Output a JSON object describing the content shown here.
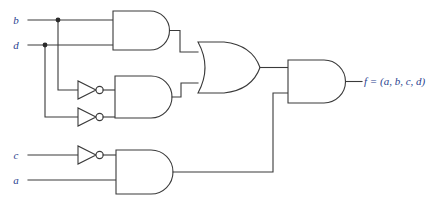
{
  "figure": {
    "type": "logic-circuit-diagram",
    "width": 438,
    "height": 205,
    "background_color": "#ffffff",
    "wire_color": "#3a3a3a",
    "label_color": "#2b3f8f"
  },
  "inputs": [
    {
      "id": "b",
      "label": "b",
      "x": 16,
      "y": 24,
      "wire_y": 20
    },
    {
      "id": "d",
      "label": "d",
      "x": 16,
      "y": 49,
      "wire_y": 45
    },
    {
      "id": "c",
      "label": "c",
      "x": 16,
      "y": 159,
      "wire_y": 155
    },
    {
      "id": "a",
      "label": "a",
      "x": 16,
      "y": 184,
      "wire_y": 180
    }
  ],
  "output": {
    "id": "f",
    "label": "f = (a, b, c, d)",
    "x": 362,
    "y": 85
  },
  "gates": [
    {
      "id": "and1",
      "type": "AND",
      "label": "AND",
      "inputs": [
        "b",
        "d"
      ],
      "x": 113,
      "y": 11,
      "w": 57,
      "h": 39
    },
    {
      "id": "and2",
      "type": "AND",
      "label": "AND",
      "inputs": [
        "not-b",
        "not-d"
      ],
      "x": 115,
      "y": 76,
      "w": 57,
      "h": 42
    },
    {
      "id": "or1",
      "type": "OR",
      "label": "OR",
      "inputs": [
        "and1",
        "and2"
      ],
      "x": 198,
      "y": 42,
      "w": 62,
      "h": 51
    },
    {
      "id": "and3",
      "type": "AND",
      "label": "AND",
      "inputs": [
        "not-c",
        "a"
      ],
      "x": 116,
      "y": 150,
      "w": 57,
      "h": 44
    },
    {
      "id": "and4",
      "type": "AND",
      "label": "AND",
      "inputs": [
        "or1",
        "and3"
      ],
      "x": 288,
      "y": 60,
      "w": 57,
      "h": 43
    }
  ],
  "inverters": [
    {
      "id": "inv-b",
      "type": "NOT",
      "label": "NOT",
      "input": "b",
      "x": 78,
      "y": 83
    },
    {
      "id": "inv-d",
      "type": "NOT",
      "label": "NOT",
      "input": "d",
      "x": 78,
      "y": 110
    },
    {
      "id": "inv-c",
      "type": "NOT",
      "label": "NOT",
      "input": "c",
      "x": 78,
      "y": 155
    }
  ],
  "junctions": [
    {
      "id": "b-tap",
      "on": "b",
      "x": 58,
      "y": 20
    },
    {
      "id": "d-tap",
      "on": "d",
      "x": 45,
      "y": 45
    }
  ]
}
